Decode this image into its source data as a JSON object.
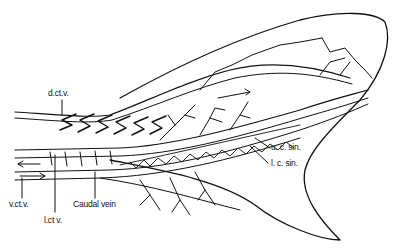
{
  "figure": {
    "labels": {
      "dctv": "d.ct.v.",
      "vctv": "v.ct.v.",
      "lctv": "l.ct v.",
      "caudal_vein": "Caudal vein",
      "ucsin": "u. c. sin.",
      "lcsin": "l. c. sin."
    }
  }
}
